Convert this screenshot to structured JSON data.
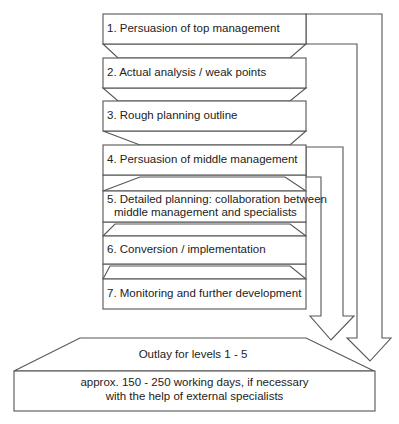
{
  "diagram": {
    "steps": [
      {
        "label": "1. Persuasion of top management"
      },
      {
        "label": "2. Actual analysis / weak points"
      },
      {
        "label": "3. Rough planning outline"
      },
      {
        "label": "4. Persuasion of middle management"
      },
      {
        "label_line1": "5. Detailed planning: collaboration between",
        "label_line2": "middle management and specialists"
      },
      {
        "label": "6. Conversion / implementation"
      },
      {
        "label": "7. Monitoring and further development"
      }
    ],
    "outlay": {
      "title": "Outlay for levels 1 - 5",
      "line1": "approx. 150 - 250 working days, if necessary",
      "line2": "with the help of external specialists"
    },
    "arrows": [
      {
        "name": "arrow-from-level-1",
        "from_step": 1
      },
      {
        "name": "arrow-from-level-4",
        "from_step": 4
      }
    ],
    "colors": {
      "stroke": "#555555",
      "fill": "#ffffff",
      "text": "#222222"
    }
  }
}
